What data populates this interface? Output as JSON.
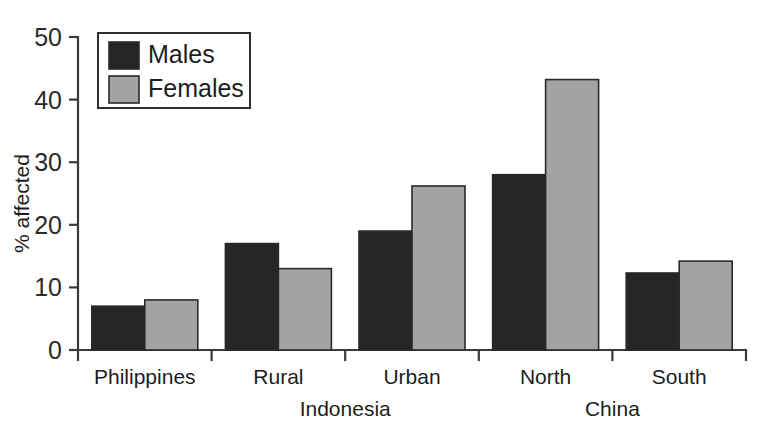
{
  "chart_data": {
    "type": "bar",
    "title": "",
    "subtitle": "",
    "xlabel": "",
    "ylabel": "% affected",
    "ylim": [
      0,
      50
    ],
    "yticks": [
      0,
      10,
      20,
      30,
      40,
      50
    ],
    "ytick_labels": [
      "0",
      "10",
      "20",
      "30",
      "40",
      "50"
    ],
    "grid": false,
    "categories": [
      "Philippines",
      "Rural",
      "Urban",
      "North",
      "South"
    ],
    "group_labels": [
      {
        "label": "Indonesia",
        "spans": [
          "Rural",
          "Urban"
        ]
      },
      {
        "label": "China",
        "spans": [
          "North",
          "South"
        ]
      }
    ],
    "series": [
      {
        "name": "Males",
        "color": "#262626",
        "values": [
          7,
          17,
          19,
          28,
          12.3
        ]
      },
      {
        "name": "Females",
        "color": "#a3a3a3",
        "values": [
          8,
          13,
          26.2,
          43.2,
          14.2
        ]
      }
    ],
    "legend": {
      "position": "top-left",
      "entries": [
        {
          "label": "Males",
          "color": "#262626"
        },
        {
          "label": "Females",
          "color": "#a3a3a3"
        }
      ]
    }
  }
}
